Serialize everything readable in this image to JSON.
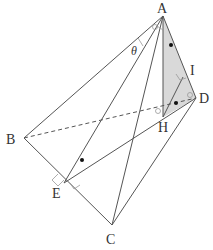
{
  "diagram": {
    "type": "3d-geometry-figure",
    "points": {
      "A": {
        "label": "A",
        "x": 163,
        "y": 16
      },
      "B": {
        "label": "B",
        "x": 24,
        "y": 138
      },
      "C": {
        "label": "C",
        "x": 112,
        "y": 225
      },
      "D": {
        "label": "D",
        "x": 196,
        "y": 98
      },
      "E": {
        "label": "E",
        "x": 64,
        "y": 183
      },
      "H": {
        "label": "H",
        "x": 163,
        "y": 117
      },
      "I": {
        "label": "I",
        "x": 183,
        "y": 77
      }
    },
    "angle_label": "θ",
    "shaded_region": "triangle AHI",
    "shade_color": "#d6d6d6",
    "line_color": "#555555"
  }
}
